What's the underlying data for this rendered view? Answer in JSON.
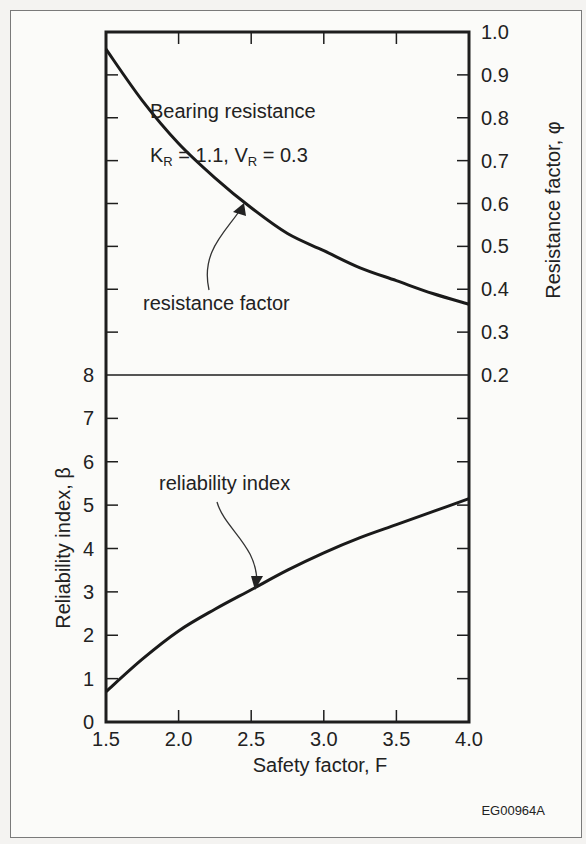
{
  "figure_id": "EG00964A",
  "annotation": {
    "title": "Bearing resistance",
    "params_k_label": "K",
    "params_k_sub": "R",
    "params_k_value": " = 1.1, V",
    "params_v_sub": "R",
    "params_v_value": " = 0.3"
  },
  "labels": {
    "resistance_curve": "resistance factor",
    "reliability_curve": "reliability index"
  },
  "chart_data": [
    {
      "type": "line",
      "title": "Bearing resistance (K_R = 1.1, V_R = 0.3)",
      "xlabel": "Safety factor, F",
      "ylabel": "Resistance factor, φ",
      "y_axis_position": "right",
      "xlim": [
        1.5,
        4.0
      ],
      "ylim": [
        0.2,
        1.0
      ],
      "x_ticks": [
        "1.5",
        "2.0",
        "2.5",
        "3.0",
        "3.5",
        "4.0"
      ],
      "y_ticks": [
        "0.2",
        "0.3",
        "0.4",
        "0.5",
        "0.6",
        "0.7",
        "0.8",
        "0.9",
        "1.0"
      ],
      "grid": false,
      "series": [
        {
          "name": "resistance factor",
          "x": [
            1.5,
            1.75,
            2.0,
            2.25,
            2.5,
            2.75,
            3.0,
            3.25,
            3.5,
            3.75,
            4.0
          ],
          "values": [
            0.96,
            0.84,
            0.74,
            0.66,
            0.59,
            0.53,
            0.49,
            0.45,
            0.42,
            0.39,
            0.365
          ]
        }
      ]
    },
    {
      "type": "line",
      "xlabel": "Safety factor, F",
      "ylabel": "Reliability index, β",
      "y_axis_position": "left",
      "xlim": [
        1.5,
        4.0
      ],
      "ylim": [
        0,
        8
      ],
      "x_ticks": [
        "1.5",
        "2.0",
        "2.5",
        "3.0",
        "3.5",
        "4.0"
      ],
      "y_ticks": [
        "0",
        "1",
        "2",
        "3",
        "4",
        "5",
        "6",
        "7",
        "8"
      ],
      "grid": false,
      "series": [
        {
          "name": "reliability index",
          "x": [
            1.5,
            1.75,
            2.0,
            2.25,
            2.5,
            2.75,
            3.0,
            3.25,
            3.5,
            3.75,
            4.0
          ],
          "values": [
            0.7,
            1.45,
            2.1,
            2.6,
            3.05,
            3.5,
            3.9,
            4.25,
            4.55,
            4.85,
            5.15
          ]
        }
      ]
    }
  ]
}
